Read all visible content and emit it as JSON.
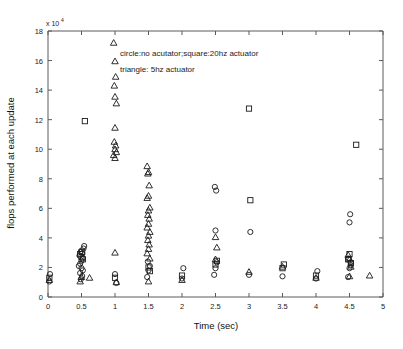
{
  "figure": {
    "background_color": "#ffffff",
    "marker_color": "#1a1a1a",
    "axis_color": "#5a5a5a"
  },
  "axes": {
    "y_exponent_prefix": "x 10",
    "y_exponent_value": "4",
    "x_tick_labels": [
      "0",
      "0.5",
      "1",
      "1.5",
      "2",
      "2.5",
      "3",
      "3.5",
      "4",
      "4.5",
      "5"
    ],
    "y_tick_labels": [
      "0",
      "2",
      "4",
      "6",
      "8",
      "10",
      "12",
      "14",
      "16",
      "18"
    ]
  },
  "legend": {
    "line1": "circle:no acutator;square:20hz actuator",
    "line2": "triangle: 5hz actuator"
  },
  "chart_data": {
    "type": "scatter",
    "title": "",
    "xlabel": "Time (sec)",
    "ylabel": "flops performed at each update",
    "xlim": [
      0,
      5
    ],
    "ylim": [
      0,
      18
    ],
    "y_scale_exponent": 4,
    "grid": false,
    "legend_position": "inside-top-center",
    "xticks": [
      0,
      0.5,
      1,
      1.5,
      2,
      2.5,
      3,
      3.5,
      4,
      4.5,
      5
    ],
    "yticks": [
      0,
      2,
      4,
      6,
      8,
      10,
      12,
      14,
      16,
      18
    ],
    "series": [
      {
        "name": "no acutator",
        "marker": "circle",
        "points": [
          [
            0.02,
            1.05
          ],
          [
            0.03,
            1.55
          ],
          [
            0.48,
            2.25
          ],
          [
            0.5,
            2.45
          ],
          [
            0.52,
            2.62
          ],
          [
            0.47,
            2.8
          ],
          [
            0.51,
            2.95
          ],
          [
            0.49,
            3.1
          ],
          [
            0.53,
            3.28
          ],
          [
            0.46,
            2.1
          ],
          [
            0.5,
            1.95
          ],
          [
            0.52,
            1.8
          ],
          [
            0.48,
            1.62
          ],
          [
            0.51,
            1.42
          ],
          [
            0.49,
            1.2
          ],
          [
            0.54,
            3.45
          ],
          [
            1.0,
            1.55
          ],
          [
            1.02,
            0.95
          ],
          [
            1.48,
            1.35
          ],
          [
            1.5,
            1.8
          ],
          [
            1.52,
            2.1
          ],
          [
            1.49,
            2.4
          ],
          [
            2.0,
            1.25
          ],
          [
            2.02,
            1.95
          ],
          [
            2.48,
            1.5
          ],
          [
            2.5,
            1.95
          ],
          [
            2.52,
            2.35
          ],
          [
            2.49,
            7.45
          ],
          [
            2.51,
            7.2
          ],
          [
            2.5,
            4.5
          ],
          [
            3.0,
            1.5
          ],
          [
            3.02,
            4.4
          ],
          [
            3.5,
            1.4
          ],
          [
            4.0,
            1.25
          ],
          [
            4.02,
            1.75
          ],
          [
            4.48,
            1.35
          ],
          [
            4.5,
            1.95
          ],
          [
            4.52,
            2.35
          ],
          [
            4.49,
            2.6
          ],
          [
            4.51,
            5.6
          ],
          [
            4.5,
            5.05
          ],
          [
            4.52,
            2.15
          ]
        ]
      },
      {
        "name": "20hz actuator",
        "marker": "square",
        "points": [
          [
            0.02,
            1.3
          ],
          [
            0.5,
            2.7
          ],
          [
            0.52,
            2.55
          ],
          [
            0.48,
            2.9
          ],
          [
            0.51,
            3.05
          ],
          [
            0.55,
            11.9
          ],
          [
            1.0,
            1.3
          ],
          [
            1.5,
            2.0
          ],
          [
            1.52,
            1.75
          ],
          [
            2.0,
            1.45
          ],
          [
            2.5,
            2.2
          ],
          [
            2.52,
            2.45
          ],
          [
            3.0,
            12.75
          ],
          [
            3.02,
            6.55
          ],
          [
            3.5,
            1.95
          ],
          [
            3.52,
            2.2
          ],
          [
            4.0,
            1.45
          ],
          [
            4.48,
            2.55
          ],
          [
            4.5,
            2.9
          ],
          [
            4.52,
            2.3
          ],
          [
            4.6,
            10.3
          ]
        ]
      },
      {
        "name": "5hz actuator",
        "marker": "triangle",
        "points": [
          [
            0.02,
            1.15
          ],
          [
            0.48,
            1.05
          ],
          [
            0.5,
            1.35
          ],
          [
            0.62,
            1.3
          ],
          [
            0.98,
            17.2
          ],
          [
            1.0,
            15.95
          ],
          [
            1.01,
            14.9
          ],
          [
            0.99,
            14.3
          ],
          [
            1.0,
            13.55
          ],
          [
            1.02,
            13.1
          ],
          [
            1.0,
            11.45
          ],
          [
            0.99,
            10.5
          ],
          [
            1.01,
            10.25
          ],
          [
            1.0,
            10.0
          ],
          [
            1.02,
            9.8
          ],
          [
            0.98,
            9.6
          ],
          [
            1.0,
            9.4
          ],
          [
            1.0,
            3.0
          ],
          [
            1.02,
            1.0
          ],
          [
            1.48,
            8.85
          ],
          [
            1.5,
            8.45
          ],
          [
            1.49,
            8.35
          ],
          [
            1.51,
            7.55
          ],
          [
            1.5,
            6.85
          ],
          [
            1.48,
            6.7
          ],
          [
            1.52,
            6.05
          ],
          [
            1.5,
            5.85
          ],
          [
            1.49,
            5.55
          ],
          [
            1.51,
            5.3
          ],
          [
            1.5,
            4.95
          ],
          [
            1.48,
            4.7
          ],
          [
            1.52,
            4.4
          ],
          [
            1.5,
            4.15
          ],
          [
            1.49,
            3.85
          ],
          [
            1.51,
            3.55
          ],
          [
            1.5,
            3.25
          ],
          [
            1.48,
            2.95
          ],
          [
            1.52,
            2.6
          ],
          [
            1.5,
            1.05
          ],
          [
            2.0,
            1.15
          ],
          [
            2.5,
            4.05
          ],
          [
            2.52,
            3.35
          ],
          [
            2.5,
            2.55
          ],
          [
            3.0,
            1.7
          ],
          [
            3.5,
            2.05
          ],
          [
            4.0,
            1.3
          ],
          [
            4.48,
            2.85
          ],
          [
            4.5,
            2.55
          ],
          [
            4.52,
            2.05
          ],
          [
            4.5,
            1.4
          ],
          [
            4.8,
            1.45
          ]
        ]
      }
    ]
  }
}
